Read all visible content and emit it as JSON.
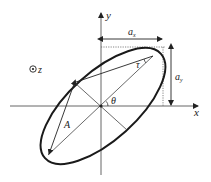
{
  "diagram": {
    "labels": {
      "x_axis": "x",
      "y_axis": "y",
      "z_axis": "z",
      "ax_main": "a",
      "ax_sub": "x",
      "ay_main": "a",
      "ay_sub": "y",
      "tau": "τ",
      "theta": "θ",
      "A": "A"
    },
    "colors": {
      "stroke": "#222222",
      "axis": "#555555",
      "dotted": "#666666"
    }
  }
}
